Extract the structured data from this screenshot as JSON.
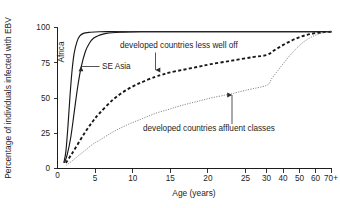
{
  "chart_data": {
    "type": "line",
    "title": "",
    "xlabel": "Age (years)",
    "ylabel": "Percentage of individuals infected with EBV",
    "xlim": [
      0,
      70
    ],
    "ylim": [
      0,
      100
    ],
    "grid": false,
    "legend_position": "inline-annotations",
    "x_axis_note": "linear from 0 to 30, compressed from 30 to 70+",
    "xticks": [
      0,
      5,
      10,
      15,
      20,
      25,
      30,
      40,
      50,
      60,
      70
    ],
    "xtick_labels": [
      "0",
      "5",
      "10",
      "15",
      "20",
      "25",
      "30",
      "40",
      "50",
      "60",
      "70+"
    ],
    "yticks": [
      0,
      25,
      50,
      75,
      100
    ],
    "ytick_labels": [
      "0",
      "25",
      "50",
      "75",
      "100"
    ],
    "series": [
      {
        "name": "Africa",
        "style": "solid",
        "color": "#171717",
        "x": [
          0.9,
          1.2,
          1.5,
          1.8,
          2.1,
          2.4,
          2.8,
          3.2,
          3.8,
          4.5,
          6,
          10,
          20,
          30,
          40,
          50,
          60,
          70
        ],
        "values": [
          4,
          12,
          30,
          52,
          70,
          82,
          90,
          94,
          96,
          96.5,
          97,
          97,
          97,
          97,
          97,
          97,
          97,
          97
        ]
      },
      {
        "name": "SE Asia",
        "style": "solid",
        "color": "#171717",
        "x": [
          1.0,
          1.4,
          1.9,
          2.4,
          2.9,
          3.4,
          4.0,
          4.6,
          5.2,
          6.0,
          7.0,
          9,
          12,
          20,
          30,
          40,
          50,
          60,
          70
        ],
        "values": [
          4,
          10,
          22,
          40,
          58,
          72,
          83,
          89,
          92.5,
          94.5,
          95.8,
          96.6,
          97,
          97,
          97,
          97,
          97,
          97,
          97
        ]
      },
      {
        "name": "developed countries less well off",
        "style": "dashed",
        "color": "#171717",
        "x": [
          1.2,
          2,
          3,
          4,
          5,
          6,
          8,
          10,
          12,
          14,
          15,
          16,
          18,
          20,
          22,
          25,
          28,
          30,
          35,
          40,
          45,
          50,
          55,
          60,
          65,
          70
        ],
        "values": [
          4,
          10,
          18,
          26,
          33,
          39,
          49,
          56,
          61,
          65,
          66.5,
          68,
          70,
          72,
          74,
          76.5,
          79,
          80.5,
          84,
          87.5,
          90.5,
          93,
          94.8,
          96,
          96.7,
          97
        ]
      },
      {
        "name": "developed countries affluent classes",
        "style": "dotted",
        "color": "#6e6e6e",
        "x": [
          1.2,
          2,
          3,
          4,
          5,
          6,
          8,
          10,
          12,
          14,
          16,
          18,
          20,
          22,
          24,
          25,
          27,
          30,
          33,
          36,
          40,
          45,
          50,
          55,
          60,
          65,
          70
        ],
        "values": [
          2,
          5,
          9,
          13,
          17,
          20,
          26,
          31,
          35,
          39,
          42,
          45,
          47.5,
          50,
          52,
          53,
          55.5,
          59,
          63.5,
          68,
          74,
          81,
          87,
          91.5,
          94.5,
          96.3,
          97
        ]
      }
    ],
    "annotations": [
      {
        "name": "africa-label",
        "text": "Africa",
        "orientation": "vertical",
        "has_leader": false
      },
      {
        "name": "se-asia-label",
        "text": "SE Asia",
        "orientation": "horizontal",
        "has_leader": true,
        "leader": "arrow-left"
      },
      {
        "name": "less-well-off-label",
        "text": "developed countries less well off",
        "orientation": "horizontal",
        "has_leader": true,
        "leader": "arrow-down"
      },
      {
        "name": "affluent-classes-label",
        "text": "developed countries affluent classes",
        "orientation": "horizontal",
        "has_leader": true,
        "leader": "arrow-up"
      }
    ]
  }
}
